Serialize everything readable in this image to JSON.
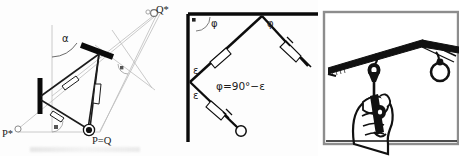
{
  "figure": {
    "panel_count": 3
  },
  "panels": {
    "geometry": {
      "name": "reflection-geometry-diagram",
      "labels": {
        "alpha": "α",
        "q_star": "Q*",
        "p_star": "P*",
        "p_equals_q": "P=Q"
      },
      "markers": {
        "q_star_point": "open-circle",
        "p_star_point": "open-circle",
        "pq_point": "filled-target-circle"
      },
      "annotations": {
        "right_angle_bottom": "right-angle-square",
        "right_angle_right": "right-angle-square"
      },
      "elements": {
        "mirror_upper": "tilted thick mirror bar",
        "mirror_left": "vertical thick mirror bar",
        "rays": "light ray triangle with direction arrows",
        "construction_lines": "light grey construction lines"
      }
    },
    "angles": {
      "name": "angle-relation-diagram",
      "labels": {
        "phi_left": "φ",
        "phi_right": "φ",
        "epsilon_upper": "ε",
        "epsilon_lower": "ε",
        "relation": "φ=90°−ε"
      },
      "annotations": {
        "right_angle_corner": "right-angle-square"
      },
      "elements": {
        "wall_vertical": "thick vertical wall line",
        "wall_horizontal": "thick horizontal ceiling line",
        "beam_up": "beam toward apex",
        "beam_down": "beam toward pendulum",
        "pendulum_bob": "open circle bob",
        "tick_marks": "equal-length hatch marks"
      }
    },
    "photo": {
      "name": "plumb-bob-illustration",
      "elements": {
        "frame": "rectangular photo border",
        "rail": "ceiling rail / beam",
        "hand": "hand gripping device",
        "bob_near": "hanging bob near",
        "bob_far": "hanging bob far",
        "ring": "suspension ring"
      }
    }
  },
  "colors": {
    "ink": "#111111",
    "construction": "#b9b9b9",
    "ray": "#2a2a2a",
    "paper": "#ffffff",
    "frame": "#8d8d8d"
  }
}
